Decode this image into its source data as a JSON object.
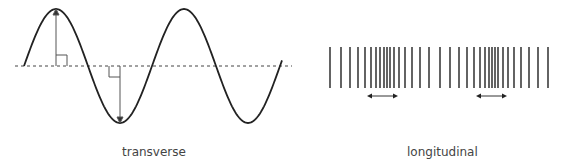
{
  "diagram": {
    "transverse": {
      "label": "transverse",
      "wave_color": "#222222",
      "axis_style": "dashed",
      "annotations": [
        "amplitude arrow up at crest",
        "amplitude arrow down at trough",
        "right-angle markers"
      ]
    },
    "longitudinal": {
      "label": "longitudinal",
      "line_color": "#222222",
      "line_x": [
        330,
        341,
        350,
        358,
        365,
        371,
        376,
        380,
        384,
        387,
        390,
        394,
        399,
        405,
        412,
        420,
        429,
        440,
        450,
        459,
        467,
        474,
        480,
        485,
        489,
        492,
        495,
        498,
        503,
        508,
        514,
        521,
        529,
        538,
        548
      ],
      "arrows": [
        {
          "x1": 367,
          "x2": 398,
          "y": 96
        },
        {
          "x1": 476,
          "x2": 507,
          "y": 96
        }
      ]
    }
  }
}
